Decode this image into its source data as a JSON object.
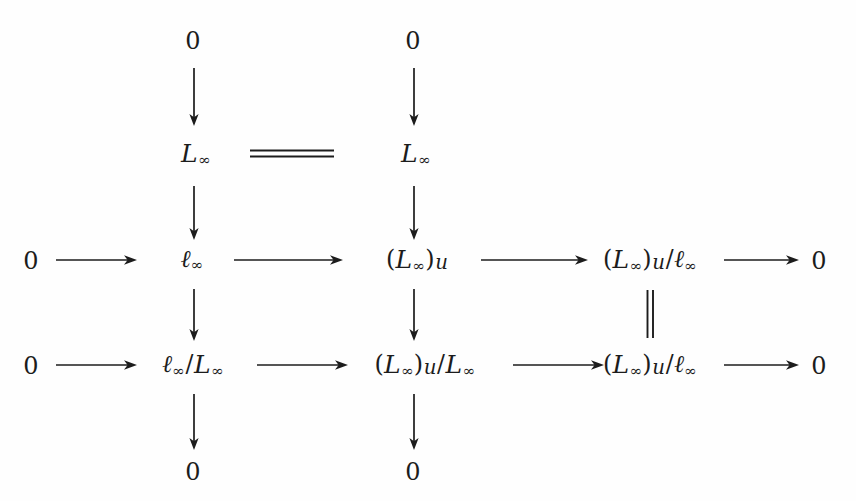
{
  "diagram": {
    "ink_color": "#1c1c1c",
    "background_color": "#fefefe",
    "nodes": {
      "r1c2": "0",
      "r1c3": "0",
      "r2c2_L": "L",
      "r2c2_sub": "∞",
      "r2c3_L": "L",
      "r2c3_sub": "∞",
      "r3c1": "0",
      "r3c2_ell": "ℓ",
      "r3c2_sub": "∞",
      "r3c3_open": "(",
      "r3c3_L": "L",
      "r3c3_sub": "∞",
      "r3c3_close": ")",
      "r3c3_u": "u",
      "r3c4_open": "(",
      "r3c4_L": "L",
      "r3c4_sub": "∞",
      "r3c4_close": ")",
      "r3c4_u": "u",
      "r3c4_slash": "/",
      "r3c4_ell": "ℓ",
      "r3c4_sub2": "∞",
      "r3c5": "0",
      "r4c1": "0",
      "r4c2_ell": "ℓ",
      "r4c2_sub": "∞",
      "r4c2_slash": "/",
      "r4c2_L": "L",
      "r4c2_sub2": "∞",
      "r4c3_open": "(",
      "r4c3_L": "L",
      "r4c3_sub": "∞",
      "r4c3_close": ")",
      "r4c3_u": "u",
      "r4c3_slash": "/",
      "r4c3_L2": "L",
      "r4c3_sub2": "∞",
      "r4c4_open": "(",
      "r4c4_L": "L",
      "r4c4_sub": "∞",
      "r4c4_close": ")",
      "r4c4_u": "u",
      "r4c4_slash": "/",
      "r4c4_ell": "ℓ",
      "r4c4_sub2": "∞",
      "r4c5": "0",
      "r5c2": "0",
      "r5c3": "0"
    },
    "node_texts": {
      "r1c2": "0",
      "r1c3": "0",
      "r2c2": "ℒ∞",
      "r2c3": "ℒ∞",
      "r3c1": "0",
      "r3c2": "ℓ∞",
      "r3c3": "(ℒ∞)u",
      "r3c4": "(ℒ∞)u/ℓ∞",
      "r3c5": "0",
      "r4c1": "0",
      "r4c2": "ℓ∞/ℒ∞",
      "r4c3": "(ℒ∞)u/ℒ∞",
      "r4c4": "(ℒ∞)u/ℓ∞",
      "r4c5": "0",
      "r5c2": "0",
      "r5c3": "0"
    },
    "equalities": {
      "horizontal_row2": "=",
      "vertical_col4": "="
    },
    "arrow_count": {
      "horizontal": 8,
      "vertical": 8,
      "equality": 2
    }
  }
}
